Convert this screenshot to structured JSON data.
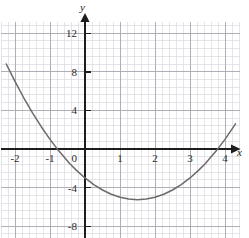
{
  "figure": {
    "name": "quadratic-parabola-graph",
    "background": "#ffffff",
    "axis_color": "#1d1d1d",
    "curve_color": "#6a6a6a",
    "grid_minor_color": "#d9d9df",
    "grid_major_color": "#a8a8b0",
    "x_axis_label": "x",
    "y_axis_label": "y"
  },
  "chart_data": {
    "type": "line",
    "title": "",
    "xlabel": "x",
    "ylabel": "y",
    "xlim": [
      -2.25,
      4.35
    ],
    "ylim": [
      -10.5,
      13.8
    ],
    "grid": true,
    "grid_minor_step": {
      "x": 0.2,
      "y": 0.8
    },
    "grid_major_step": {
      "x": 1,
      "y": 4
    },
    "legend": "none",
    "x_tick_labels": [
      "-2",
      "-1",
      "0",
      "1",
      "2",
      "3",
      "4"
    ],
    "x_tick_values": [
      -2,
      -1,
      0,
      1,
      2,
      3,
      4
    ],
    "y_tick_labels": [
      "12",
      "8",
      "4",
      "-4",
      "-8"
    ],
    "y_tick_values": [
      12,
      8,
      4,
      -4,
      -8
    ],
    "equation": "y = x^2 - 3x - 3",
    "vertex": [
      1.5,
      -3.75
    ],
    "roots": [
      -0.44,
      3.44
    ],
    "y_intercept": -3,
    "series": [
      {
        "name": "parabola",
        "x": [
          -2.25,
          -2.0,
          -1.75,
          -1.5,
          -1.25,
          -1.0,
          -0.75,
          -0.5,
          -0.44,
          -0.25,
          0,
          0.25,
          0.5,
          0.75,
          1.0,
          1.25,
          1.5,
          1.75,
          2.0,
          2.25,
          2.5,
          2.75,
          3.0,
          3.25,
          3.44,
          3.5,
          3.75,
          4.0,
          4.3
        ],
        "y": [
          8.81,
          7.0,
          5.31,
          3.75,
          2.31,
          1.0,
          -0.19,
          -1.25,
          -1.5,
          -2.19,
          -3.0,
          -3.69,
          -4.25,
          -4.69,
          -5.0,
          -5.19,
          -5.25,
          -5.19,
          -5.0,
          -4.69,
          -4.25,
          -3.69,
          -3.0,
          -2.19,
          -1.5,
          -1.25,
          -0.19,
          1.0,
          2.61
        ]
      }
    ]
  }
}
